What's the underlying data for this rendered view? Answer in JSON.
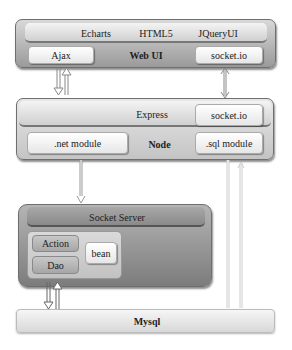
{
  "web_ui": {
    "title": "Web UI",
    "top_items": [
      "Echarts",
      "HTML5",
      "JQueryUI"
    ],
    "ajax": "Ajax",
    "socket": "socket.io"
  },
  "node": {
    "title": "Node",
    "express": "Express",
    "socket": "socket.io",
    "net_module": ".net module",
    "sql_module": ".sql module"
  },
  "socket_server": {
    "title": "Socket Server",
    "action": "Action",
    "dao": "Dao",
    "bean": "bean"
  },
  "mysql": {
    "title": "Mysql"
  },
  "connections": [
    {
      "from": "Ajax",
      "to": "Express",
      "type": "bidirectional-pair"
    },
    {
      "from": "socket.io (Web UI)",
      "to": "socket.io (Node)",
      "type": "bidirectional"
    },
    {
      "from": ".net module",
      "to": "Socket Server",
      "type": "down"
    },
    {
      "from": "Dao",
      "to": "Mysql",
      "type": "bidirectional-pair"
    },
    {
      "from": ".sql module",
      "to": "Mysql",
      "type": "bidirectional-pair"
    }
  ]
}
